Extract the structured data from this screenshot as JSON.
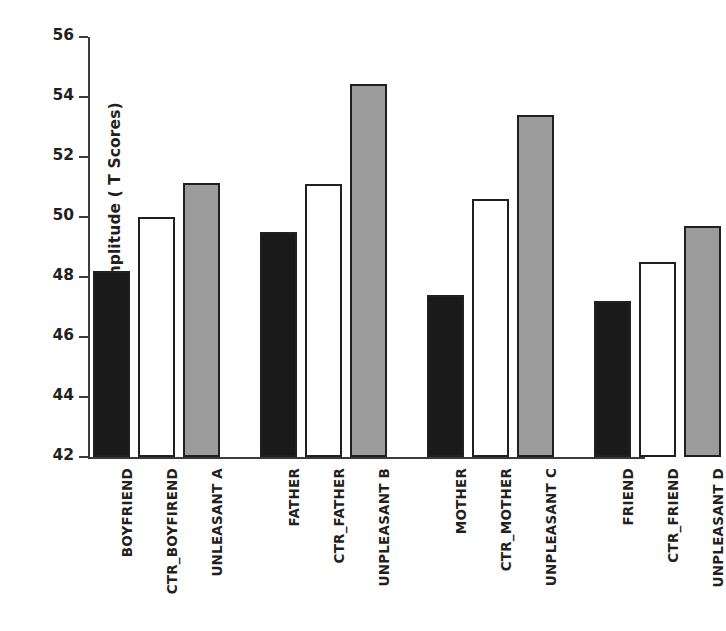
{
  "chart_data": {
    "type": "bar",
    "title": "",
    "xlabel": "",
    "ylabel": "Startle Amplitude ( T Scores)",
    "ylim": [
      42,
      56
    ],
    "yticks": [
      56,
      54,
      52,
      50,
      48,
      46,
      44,
      42
    ],
    "grid": false,
    "legend": "none",
    "categories": [
      "BOYFRIEND",
      "CTR_BOYFIREND",
      "UNLEASANT A",
      "FATHER",
      "CTR_FATHER",
      "UNPLEASANT B",
      "MOTHER",
      "CTR_MOTHER",
      "UNPLEASANT C",
      "FRIEND",
      "CTR_FRIEND",
      "UNPLEASANT D"
    ],
    "values": [
      48.2,
      50.0,
      51.15,
      49.5,
      51.1,
      54.45,
      47.4,
      50.6,
      53.4,
      47.2,
      48.5,
      49.7
    ],
    "bar_fills": [
      "dark",
      "white",
      "gray",
      "dark",
      "white",
      "gray",
      "dark",
      "white",
      "gray",
      "dark",
      "white",
      "gray"
    ],
    "groups": [
      {
        "name": "Boyfriend",
        "bars": [
          {
            "label": "BOYFRIEND",
            "value": 48.2,
            "fill": "dark"
          },
          {
            "label": "CTR_BOYFIREND",
            "value": 50.0,
            "fill": "white"
          },
          {
            "label": "UNLEASANT A",
            "value": 51.15,
            "fill": "gray"
          }
        ]
      },
      {
        "name": "Father",
        "bars": [
          {
            "label": "FATHER",
            "value": 49.5,
            "fill": "dark"
          },
          {
            "label": "CTR_FATHER",
            "value": 51.1,
            "fill": "white"
          },
          {
            "label": "UNPLEASANT B",
            "value": 54.45,
            "fill": "gray"
          }
        ]
      },
      {
        "name": "Mother",
        "bars": [
          {
            "label": "MOTHER",
            "value": 47.4,
            "fill": "dark"
          },
          {
            "label": "CTR_MOTHER",
            "value": 50.6,
            "fill": "white"
          },
          {
            "label": "UNPLEASANT C",
            "value": 53.4,
            "fill": "gray"
          }
        ]
      },
      {
        "name": "Friend",
        "bars": [
          {
            "label": "FRIEND",
            "value": 47.2,
            "fill": "dark"
          },
          {
            "label": "CTR_FRIEND",
            "value": 48.5,
            "fill": "white"
          },
          {
            "label": "UNPLEASANT D",
            "value": 49.7,
            "fill": "gray"
          }
        ]
      }
    ],
    "colors": {
      "dark": "#1a1a1a",
      "white": "#ffffff",
      "gray": "#9c9c9c",
      "outline": "#231f20",
      "axis": "#3b3b3b",
      "background": "#ffffff"
    }
  }
}
